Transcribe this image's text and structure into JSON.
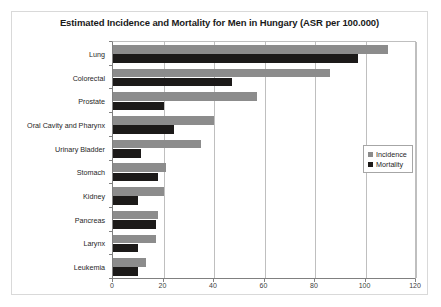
{
  "chart_data": {
    "type": "bar",
    "orientation": "horizontal",
    "title": "Estimated Incidence and Mortality for Men in Hungary (ASR per 100.000)",
    "xlabel": "",
    "ylabel": "",
    "xlim": [
      0,
      120
    ],
    "xticks": [
      0,
      20,
      40,
      60,
      80,
      100,
      120
    ],
    "xtick_labels": [
      "0",
      "20",
      "40",
      "60",
      "80",
      "100",
      "120"
    ],
    "grid": "vertical",
    "legend_position": "right-middle",
    "categories": [
      "Lung",
      "Colorectal",
      "Prostate",
      "Oral Cavity and Pharynx",
      "Urinary Bladder",
      "Stomach",
      "Kidney",
      "Pancreas",
      "Larynx",
      "Leukemia"
    ],
    "series": [
      {
        "name": "Incidence",
        "color": "#8c8c8c",
        "values": [
          109,
          86,
          57,
          40,
          35,
          21,
          20,
          18,
          17,
          13
        ]
      },
      {
        "name": "Mortality",
        "color": "#1c1a19",
        "values": [
          97,
          47,
          20,
          24,
          11,
          18,
          10,
          17,
          10,
          10
        ]
      }
    ]
  },
  "legend": {
    "items": [
      {
        "label": "Incidence",
        "swatch": "incidence"
      },
      {
        "label": "Mortality",
        "swatch": "mortality"
      }
    ]
  }
}
